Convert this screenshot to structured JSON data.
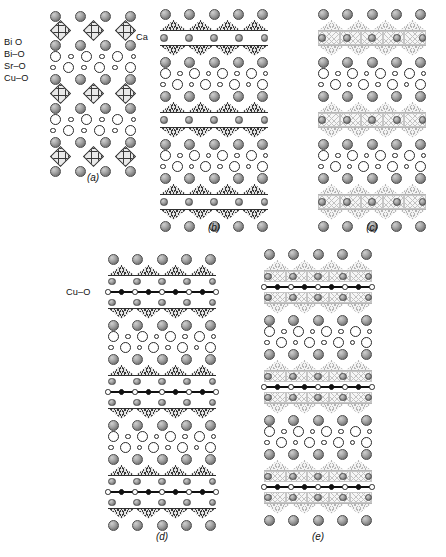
{
  "figure": {
    "caption_letters": [
      "(a)",
      "(b)",
      "(c)",
      "(d)",
      "(e)"
    ],
    "annotations": {
      "bi_o_label": "Bi O",
      "bi_dash_o_label": "Bi–O",
      "sr_o_label": "Sr–O",
      "cu_o_label": "Cu–O",
      "ca_label": "Ca",
      "cu_o_chain_label": "Cu–O"
    },
    "colors": {
      "sphere_fill": "#a8a8a8",
      "sphere_edge": "#4c4c4c",
      "open_circle_fill": "#ffffff",
      "open_circle_edge": "#2b2b2b",
      "polyhedron_hatch": "#3a3a3a",
      "polyhedron_pale_hatch": "#b6b6b6",
      "chain_atom_fill": "#111111",
      "background": "#ffffff"
    }
  },
  "chart_data": {
    "type": "diagram",
    "panels": [
      {
        "id": "a",
        "label": "(a)",
        "columns": 4,
        "side_labels": [
          "Bi O",
          "Bi–O",
          "Sr–O",
          "Cu–O"
        ],
        "layer_sequence": [
          "Sr-O sphere row",
          "Cu-O octahedra row",
          "Sr-O sphere row",
          "Bi-O open circle row",
          "Bi-O open circle row",
          "Sr-O sphere row",
          "Cu-O octahedra row",
          "Sr-O sphere row",
          "Bi-O open circle row",
          "Bi-O open circle row",
          "Sr-O sphere row",
          "Cu-O octahedra row",
          "Sr-O sphere row"
        ]
      },
      {
        "id": "b",
        "label": "(b)",
        "columns": 5,
        "side_labels": [
          "Ca"
        ],
        "layer_sequence": [
          "Sr-O sphere row",
          "Cu-O pyramid up row",
          "Ca sphere row",
          "Cu-O pyramid down row",
          "Sr-O sphere row",
          "Bi-O open circle row",
          "Bi-O open circle row",
          "Sr-O sphere row",
          "Cu-O pyramid up row",
          "Ca sphere row",
          "Cu-O pyramid down row",
          "Sr-O sphere row",
          "Bi-O open circle row",
          "Bi-O open circle row",
          "Sr-O sphere row",
          "Cu-O pyramid up row",
          "Ca sphere row",
          "Cu-O pyramid down row",
          "Sr-O sphere row"
        ]
      },
      {
        "id": "c",
        "label": "(c)",
        "columns": 5,
        "side_labels": [],
        "layer_sequence": [
          "Sr-O sphere row",
          "Cu-O pyramid up row",
          "Ca sphere row in pale cage",
          "Cu-O pyramid down row",
          "Sr-O sphere row",
          "Bi-O open circle row",
          "Bi-O open circle row",
          "Sr-O sphere row",
          "Cu-O pyramid up row",
          "Ca sphere row in pale cage",
          "Cu-O pyramid down row",
          "Sr-O sphere row",
          "Bi-O open circle row",
          "Bi-O open circle row",
          "Sr-O sphere row",
          "Cu-O pyramid up row",
          "Ca sphere row in pale cage",
          "Cu-O pyramid down row",
          "Sr-O sphere row"
        ]
      },
      {
        "id": "d",
        "label": "(d)",
        "columns": 5,
        "side_labels": [
          "Cu–O"
        ],
        "layer_sequence": [
          "Sr-O sphere row",
          "Cu-O pyramid up row",
          "Ca sphere row",
          "Cu-O chain row",
          "Ca sphere row",
          "Cu-O pyramid down row",
          "Sr-O sphere row",
          "Bi-O open circle row",
          "Bi-O open circle row",
          "Sr-O sphere row",
          "Cu-O pyramid up row",
          "Ca sphere row",
          "Cu-O chain row",
          "Ca sphere row",
          "Cu-O pyramid down row",
          "Sr-O sphere row",
          "Bi-O open circle row",
          "Bi-O open circle row",
          "Sr-O sphere row",
          "Cu-O pyramid up row",
          "Ca sphere row",
          "Cu-O chain row",
          "Ca sphere row",
          "Cu-O pyramid down row",
          "Sr-O sphere row"
        ]
      },
      {
        "id": "e",
        "label": "(e)",
        "columns": 5,
        "side_labels": [],
        "layer_sequence": [
          "Sr-O sphere row",
          "Cu-O pyramid up row",
          "Ca sphere row in pale cage",
          "Cu-O chain row",
          "Ca sphere row in pale cage",
          "Cu-O pyramid down row",
          "Sr-O sphere row",
          "Bi-O open circle row",
          "Bi-O open circle row",
          "Sr-O sphere row",
          "Cu-O pyramid up row",
          "Ca sphere row in pale cage",
          "Cu-O chain row",
          "Ca sphere row in pale cage",
          "Cu-O pyramid down row",
          "Sr-O sphere row",
          "Bi-O open circle row",
          "Bi-O open circle row",
          "Sr-O sphere row",
          "Cu-O pyramid up row",
          "Ca sphere row in pale cage",
          "Cu-O chain row",
          "Ca sphere row in pale cage",
          "Cu-O pyramid down row",
          "Sr-O sphere row"
        ]
      }
    ],
    "legend": [
      {
        "symbol": "large shaded sphere",
        "meaning": "Sr or Ca or Bi cation"
      },
      {
        "symbol": "small shaded sphere",
        "meaning": "Ca cation"
      },
      {
        "symbol": "open circle",
        "meaning": "Bi-O layer atom"
      },
      {
        "symbol": "hatched diamond",
        "meaning": "CuO6 octahedron"
      },
      {
        "symbol": "hatched triangle",
        "meaning": "CuO5 pyramid"
      },
      {
        "symbol": "filled dot on line",
        "meaning": "Cu-O chain atom"
      }
    ]
  }
}
